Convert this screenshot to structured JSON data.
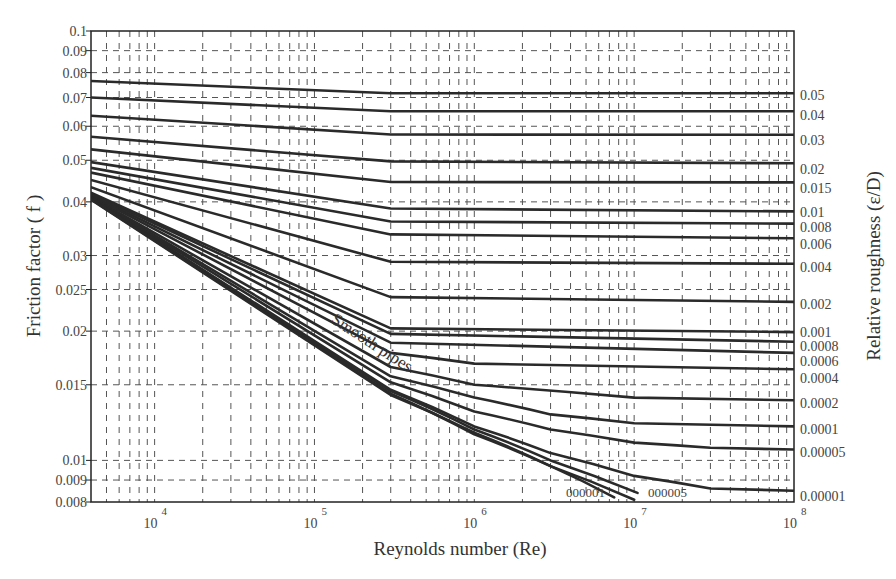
{
  "chart_data": {
    "type": "line",
    "xlabel": "Reynolds number (Re)",
    "ylabel": "Friction factor ( f )",
    "y2label": "Relative roughness (ε/D)",
    "xscale": "log",
    "yscale": "log",
    "xlim": [
      4000,
      100000000
    ],
    "ylim": [
      0.008,
      0.1
    ],
    "grid": true,
    "grid_style": "dashed",
    "x_ticks": [
      {
        "value": 10000,
        "base": "10",
        "exp": "4"
      },
      {
        "value": 100000,
        "base": "10",
        "exp": "5"
      },
      {
        "value": 1000000,
        "base": "10",
        "exp": "6"
      },
      {
        "value": 10000000,
        "base": "10",
        "exp": "7"
      },
      {
        "value": 100000000,
        "base": "10",
        "exp": "8"
      }
    ],
    "y_ticks": [
      {
        "value": 0.1,
        "label": "0.1"
      },
      {
        "value": 0.09,
        "label": "0.09"
      },
      {
        "value": 0.08,
        "label": "0.08"
      },
      {
        "value": 0.07,
        "label": "0.07"
      },
      {
        "value": 0.06,
        "label": "0.06"
      },
      {
        "value": 0.05,
        "label": "0.05"
      },
      {
        "value": 0.04,
        "label": "0.04"
      },
      {
        "value": 0.03,
        "label": "0.03"
      },
      {
        "value": 0.025,
        "label": "0.025"
      },
      {
        "value": 0.02,
        "label": "0.02"
      },
      {
        "value": 0.015,
        "label": "0.015"
      },
      {
        "value": 0.01,
        "label": "0.01"
      },
      {
        "value": 0.009,
        "label": "0.009"
      },
      {
        "value": 0.008,
        "label": "0.008"
      }
    ],
    "annotations": [
      {
        "text": "Smooth pipes",
        "x": 330,
        "y": 322,
        "rotate": 33
      },
      {
        "text": "000001",
        "x": 566,
        "y": 497
      },
      {
        "text": "000005",
        "x": 648,
        "y": 497
      }
    ],
    "series": [
      {
        "name": "0.05",
        "label_y": 121,
        "points": [
          [
            4000,
            0.0765
          ],
          [
            300000,
            0.0716
          ],
          [
            100000000,
            0.0716
          ]
        ]
      },
      {
        "name": "0.04",
        "label_y": 141,
        "points": [
          [
            4000,
            0.07
          ],
          [
            300000,
            0.065
          ],
          [
            100000000,
            0.065
          ]
        ]
      },
      {
        "name": "0.03",
        "label_y": 166,
        "points": [
          [
            4000,
            0.0635
          ],
          [
            300000,
            0.0574
          ],
          [
            100000000,
            0.0573
          ]
        ]
      },
      {
        "name": "0.02",
        "label_y": 195,
        "points": [
          [
            4000,
            0.0567
          ],
          [
            300000,
            0.0497
          ],
          [
            100000000,
            0.0492
          ]
        ]
      },
      {
        "name": "0.015",
        "label_y": 214,
        "points": [
          [
            4000,
            0.053
          ],
          [
            300000,
            0.0445
          ],
          [
            100000000,
            0.0444
          ]
        ]
      },
      {
        "name": "0.01",
        "label_y": 238,
        "points": [
          [
            4000,
            0.0495
          ],
          [
            300000,
            0.0386
          ],
          [
            100000000,
            0.038
          ]
        ]
      },
      {
        "name": "0.008",
        "label_y": 253,
        "points": [
          [
            4000,
            0.048
          ],
          [
            300000,
            0.036
          ],
          [
            100000000,
            0.0356
          ]
        ]
      },
      {
        "name": "0.006",
        "label_y": 270,
        "points": [
          [
            4000,
            0.0468
          ],
          [
            300000,
            0.0336
          ],
          [
            100000000,
            0.0329
          ]
        ]
      },
      {
        "name": "0.004",
        "label_y": 293,
        "points": [
          [
            4000,
            0.045
          ],
          [
            300000,
            0.029
          ],
          [
            100000000,
            0.0287
          ]
        ]
      },
      {
        "name": "0.002",
        "label_y": 330,
        "points": [
          [
            4000,
            0.0433
          ],
          [
            300000,
            0.024
          ],
          [
            100000000,
            0.0234
          ]
        ]
      },
      {
        "name": "0.001",
        "label_y": 358,
        "points": [
          [
            4000,
            0.042
          ],
          [
            300000,
            0.0203
          ],
          [
            100000000,
            0.0199
          ]
        ]
      },
      {
        "name": "0.0008",
        "label_y": 372,
        "points": [
          [
            4000,
            0.0418
          ],
          [
            300000,
            0.0197
          ],
          [
            100000000,
            0.0189
          ]
        ]
      },
      {
        "name": "0.0006",
        "label_y": 387,
        "points": [
          [
            4000,
            0.0415
          ],
          [
            300000,
            0.0188
          ],
          [
            100000000,
            0.0178
          ]
        ]
      },
      {
        "name": "0.0004",
        "label_y": 404,
        "points": [
          [
            4000,
            0.0413
          ],
          [
            300000,
            0.0178
          ],
          [
            1000000,
            0.0168
          ],
          [
            100000000,
            0.0163
          ]
        ]
      },
      {
        "name": "0.0002",
        "label_y": 429,
        "points": [
          [
            4000,
            0.0411
          ],
          [
            300000,
            0.0165
          ],
          [
            1000000,
            0.015
          ],
          [
            10000000,
            0.014
          ],
          [
            100000000,
            0.0138
          ]
        ]
      },
      {
        "name": "0.0001",
        "label_y": 455,
        "points": [
          [
            4000,
            0.041
          ],
          [
            300000,
            0.0157
          ],
          [
            1000000,
            0.014
          ],
          [
            3000000,
            0.0128
          ],
          [
            10000000,
            0.0122
          ],
          [
            100000000,
            0.012
          ]
        ]
      },
      {
        "name": "0.00005",
        "label_y": 478,
        "points": [
          [
            4000,
            0.0409
          ],
          [
            300000,
            0.0152
          ],
          [
            1000000,
            0.013
          ],
          [
            3000000,
            0.0118
          ],
          [
            10000000,
            0.011
          ],
          [
            30000000,
            0.0107
          ],
          [
            100000000,
            0.0106
          ]
        ]
      },
      {
        "name": "0.00001",
        "label_y": 522,
        "points": [
          [
            4000,
            0.0408
          ],
          [
            300000,
            0.0146
          ],
          [
            1000000,
            0.012
          ],
          [
            3000000,
            0.0104
          ],
          [
            10000000,
            0.0092
          ],
          [
            30000000,
            0.0086
          ],
          [
            100000000,
            0.0085
          ]
        ]
      },
      {
        "name": "0.000005",
        "label_y": null,
        "points": [
          [
            4000,
            0.0407
          ],
          [
            300000,
            0.0145
          ],
          [
            1000000,
            0.0118
          ],
          [
            3000000,
            0.01
          ],
          [
            10500000,
            0.0084
          ]
        ]
      },
      {
        "name": "0.000001",
        "label_y": null,
        "points": [
          [
            4000,
            0.0406
          ],
          [
            300000,
            0.0143
          ],
          [
            1000000,
            0.0115
          ],
          [
            3000000,
            0.0097
          ],
          [
            10000000,
            0.0081
          ]
        ]
      },
      {
        "name": "Smooth pipes",
        "label_y": null,
        "points": [
          [
            4000,
            0.0405
          ],
          [
            300000,
            0.0142
          ],
          [
            1000000,
            0.0116
          ],
          [
            3000000,
            0.0097
          ],
          [
            7500000,
            0.0082
          ]
        ]
      }
    ]
  }
}
